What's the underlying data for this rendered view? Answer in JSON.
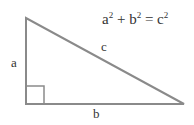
{
  "diagram": {
    "formula": {
      "a": "a",
      "exp_a": "2",
      "plus": " + ",
      "b": "b",
      "exp_b": "2",
      "equals": " = ",
      "c": "c",
      "exp_c": "2"
    },
    "labels": {
      "side_a": "a",
      "side_b": "b",
      "side_c": "c"
    },
    "colors": {
      "stroke": "#8a8a8a",
      "text": "#333333",
      "background": "#ffffff"
    },
    "vertices": {
      "top": [
        26,
        18
      ],
      "right_angle": [
        26,
        104
      ],
      "right": [
        184,
        104
      ]
    },
    "right_angle_marker_size": 18
  }
}
